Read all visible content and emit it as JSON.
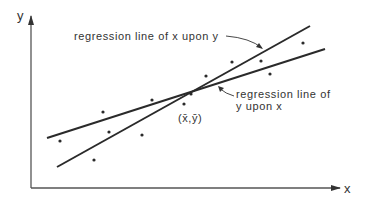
{
  "diagram": {
    "axes": {
      "x_label": "x",
      "y_label": "y",
      "color": "#444444"
    },
    "lines": [
      {
        "name": "regression line of x upon y",
        "label": "regression line of x upon y",
        "x1": 57,
        "y1": 167,
        "x2": 310,
        "y2": 26
      },
      {
        "name": "regression line of y upon x",
        "label_line1": "regression line of",
        "label_line2": "y upon x",
        "x1": 47,
        "y1": 138,
        "x2": 325,
        "y2": 49
      }
    ],
    "mean_point_label": "(x̄,ȳ)",
    "points": [
      [
        60,
        141
      ],
      [
        103,
        112
      ],
      [
        109,
        132
      ],
      [
        94,
        160
      ],
      [
        142,
        135
      ],
      [
        152,
        100
      ],
      [
        184,
        104
      ],
      [
        191,
        94
      ],
      [
        206,
        76
      ],
      [
        232,
        62
      ],
      [
        261,
        61
      ],
      [
        270,
        74
      ],
      [
        303,
        43
      ]
    ],
    "ink_color": "#2a2a2a"
  }
}
